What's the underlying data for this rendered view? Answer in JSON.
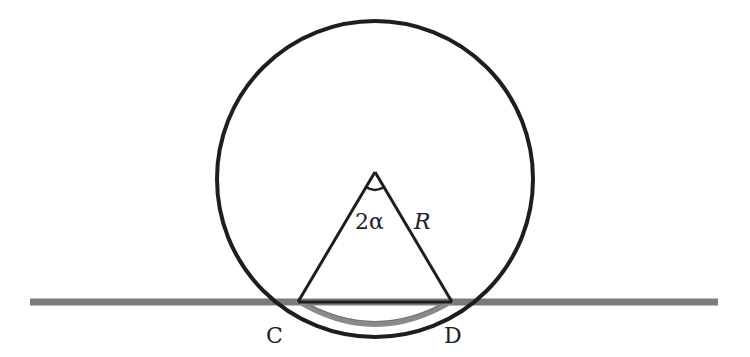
{
  "diagram": {
    "labels": {
      "angle": "2α",
      "radius": "R",
      "point_left": "C",
      "point_right": "D"
    },
    "colors": {
      "stroke": "#1e1e1e",
      "ground": "#7a7a7a",
      "contact_arc": "#8a8a8a",
      "background": "#ffffff"
    }
  }
}
